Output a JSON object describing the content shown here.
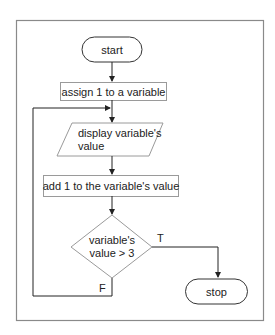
{
  "flowchart": {
    "start": "start",
    "assign": "assign 1 to a variable",
    "display_line1": "display variable's",
    "display_line2": "value",
    "add": "add 1 to the variable's value",
    "decision_line1": "variable's",
    "decision_line2": "value > 3",
    "true_label": "T",
    "false_label": "F",
    "stop": "stop"
  },
  "colors": {
    "frame": "#8a8a8a",
    "shape_border": "#9a9a9a",
    "terminal_border": "#333333",
    "arrows": "#222222",
    "text": "#222222"
  }
}
